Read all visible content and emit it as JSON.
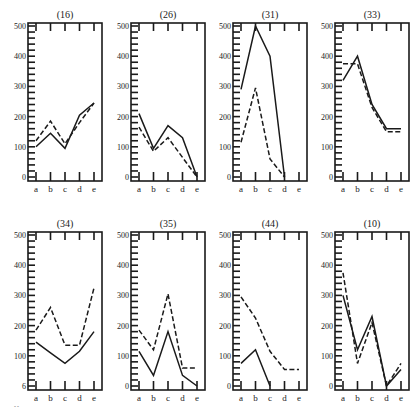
{
  "figure": {
    "corner_mark": "‑‑"
  },
  "chart_data": [
    {
      "type": "line",
      "title": "(16)",
      "categories": [
        "a",
        "b",
        "c",
        "d",
        "e"
      ],
      "ylim": [
        0,
        500
      ],
      "yticks": [
        0,
        100,
        200,
        300,
        400,
        500
      ],
      "ytick_labels": [
        "0",
        "100",
        "200",
        "300",
        "400",
        "500"
      ],
      "series": [
        {
          "name": "solid",
          "style": "solid",
          "values": [
            100,
            145,
            95,
            205,
            245
          ]
        },
        {
          "name": "dashed",
          "style": "dashed",
          "values": [
            120,
            185,
            110,
            180,
            245
          ]
        }
      ]
    },
    {
      "type": "line",
      "title": "(26)",
      "categories": [
        "a",
        "b",
        "c",
        "d",
        "e"
      ],
      "ylim": [
        0,
        500
      ],
      "yticks": [
        0,
        100,
        200,
        300,
        400,
        500
      ],
      "ytick_labels": [
        "0",
        "100",
        "200",
        "300",
        "400",
        "500"
      ],
      "series": [
        {
          "name": "solid",
          "style": "solid",
          "values": [
            210,
            95,
            170,
            130,
            0
          ]
        },
        {
          "name": "dashed",
          "style": "dashed",
          "values": [
            165,
            85,
            130,
            65,
            0
          ]
        }
      ]
    },
    {
      "type": "line",
      "title": "(31)",
      "categories": [
        "a",
        "b",
        "c",
        "d",
        "e"
      ],
      "ylim": [
        0,
        500
      ],
      "yticks": [
        0,
        100,
        200,
        300,
        400,
        500
      ],
      "ytick_labels": [
        "0",
        "100",
        "200",
        "300",
        "400",
        "500"
      ],
      "series": [
        {
          "name": "solid",
          "style": "solid",
          "values": [
            290,
            500,
            400,
            0,
            null
          ]
        },
        {
          "name": "dashed",
          "style": "dashed",
          "values": [
            115,
            295,
            60,
            0,
            null
          ]
        }
      ]
    },
    {
      "type": "line",
      "title": "(33)",
      "categories": [
        "a",
        "b",
        "c",
        "d",
        "e"
      ],
      "ylim": [
        0,
        500
      ],
      "yticks": [
        0,
        100,
        200,
        300,
        400,
        500
      ],
      "ytick_labels": [
        "0",
        "100",
        "200",
        "300",
        "400",
        "500"
      ],
      "series": [
        {
          "name": "solid",
          "style": "solid",
          "values": [
            320,
            400,
            240,
            160,
            160
          ]
        },
        {
          "name": "dashed",
          "style": "dashed",
          "values": [
            375,
            375,
            230,
            150,
            150
          ]
        }
      ]
    },
    {
      "type": "line",
      "title": "(34)",
      "categories": [
        "a",
        "b",
        "c",
        "d",
        "e"
      ],
      "ylim": [
        0,
        500
      ],
      "yticks": [
        0,
        100,
        200,
        300,
        400,
        500
      ],
      "ytick_labels": [
        "6",
        "100",
        "200",
        "300",
        "400",
        "500"
      ],
      "series": [
        {
          "name": "solid",
          "style": "solid",
          "values": [
            145,
            110,
            75,
            115,
            180
          ]
        },
        {
          "name": "dashed",
          "style": "dashed",
          "values": [
            185,
            260,
            135,
            135,
            325
          ]
        }
      ]
    },
    {
      "type": "line",
      "title": "(35)",
      "categories": [
        "a",
        "b",
        "c",
        "d",
        "e"
      ],
      "ylim": [
        0,
        500
      ],
      "yticks": [
        0,
        100,
        200,
        300,
        400,
        500
      ],
      "ytick_labels": [
        "0",
        "100",
        "200",
        "300",
        "400",
        "500"
      ],
      "series": [
        {
          "name": "solid",
          "style": "solid",
          "values": [
            115,
            35,
            180,
            35,
            0
          ]
        },
        {
          "name": "dashed",
          "style": "dashed",
          "values": [
            185,
            120,
            305,
            60,
            60
          ]
        }
      ]
    },
    {
      "type": "line",
      "title": "(44)",
      "categories": [
        "a",
        "b",
        "c",
        "d",
        "e"
      ],
      "ylim": [
        0,
        500
      ],
      "yticks": [
        0,
        100,
        200,
        300,
        400,
        500
      ],
      "ytick_labels": [
        "0",
        "100",
        "200",
        "300",
        "400",
        "500"
      ],
      "series": [
        {
          "name": "solid",
          "style": "solid",
          "values": [
            75,
            120,
            0,
            null,
            null
          ]
        },
        {
          "name": "dashed",
          "style": "dashed",
          "values": [
            295,
            225,
            115,
            55,
            55
          ]
        }
      ]
    },
    {
      "type": "line",
      "title": "(10)",
      "categories": [
        "a",
        "b",
        "c",
        "d",
        "e"
      ],
      "ylim": [
        0,
        500
      ],
      "yticks": [
        0,
        100,
        200,
        300,
        400,
        500
      ],
      "ytick_labels": [
        "0",
        "100",
        "200",
        "300",
        "400",
        "500"
      ],
      "series": [
        {
          "name": "solid",
          "style": "solid",
          "values": [
            300,
            120,
            230,
            0,
            55
          ]
        },
        {
          "name": "dashed",
          "style": "dashed",
          "values": [
            375,
            75,
            210,
            0,
            75
          ]
        }
      ]
    }
  ]
}
